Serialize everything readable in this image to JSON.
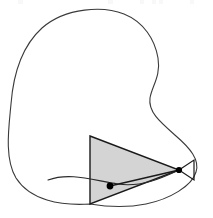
{
  "figure": {
    "canvas": {
      "width": 213,
      "height": 218,
      "background": "#ffffff"
    },
    "colors": {
      "stroke": "#3a3a3a",
      "triangle_fill": "#d4d4d4",
      "triangle_stroke": "#1a1a1a",
      "dot_fill": "#000000",
      "chord_stroke": "#1a1a1a",
      "artifact": "#f3f3f4"
    },
    "strokes": {
      "blob_width": 1.1,
      "triangle_width": 1.4,
      "chord_width": 1.3,
      "inner_curve_width": 1.1
    },
    "blob": {
      "label": "outer region boundary",
      "path": "M 90 204 C 60 206 30 200 16 178 C 4 158 9 126 11 104 C 13 78 20 48 42 28 C 66 7 104 6 124 14 C 144 22 155 40 158 58 C 161 76 152 86 150 98 C 148 112 160 122 176 136 C 190 148 200 160 196 172 C 192 186 170 199 146 204 C 126 208 108 207 90 204 Z",
      "closed": true,
      "filled": false
    },
    "inner_curve": {
      "label": "secant curve through contact points",
      "path": "M 48 180 C 70 172 92 180 118 184 C 142 188 166 176 179 170"
    },
    "triangle": {
      "label": "inscribed shaded triangle",
      "vertices": [
        {
          "name": "top-left",
          "x": 90,
          "y": 136
        },
        {
          "name": "apex-right",
          "x": 179,
          "y": 170
        },
        {
          "name": "bottom-left",
          "x": 90,
          "y": 204
        }
      ],
      "fill": "#d4d4d4",
      "stroke": "#1a1a1a"
    },
    "small_triangle": {
      "label": "outer tangent wedge",
      "vertices": [
        {
          "name": "apex-left",
          "x": 179,
          "y": 170
        },
        {
          "name": "top-right",
          "x": 194,
          "y": 160
        },
        {
          "name": "bottom-right",
          "x": 194,
          "y": 180
        }
      ],
      "fill": "none",
      "stroke": "#1a1a1a"
    },
    "chord": {
      "label": "chord joining the two marked points",
      "from": {
        "x": 110,
        "y": 186
      },
      "to": {
        "x": 179,
        "y": 170
      }
    },
    "points": [
      {
        "name": "interior-contact-point",
        "x": 110,
        "y": 186,
        "radius": 3.4
      },
      {
        "name": "boundary-contact-point",
        "x": 179,
        "y": 170,
        "radius": 3.1
      }
    ],
    "top_artifacts": [
      {
        "x": 18,
        "width": 5
      },
      {
        "x": 19,
        "width": 4
      },
      {
        "x": 108,
        "width": 5
      },
      {
        "x": 140,
        "width": 4
      },
      {
        "x": 152,
        "width": 4
      },
      {
        "x": 158,
        "width": 4
      },
      {
        "x": 190,
        "width": 4
      }
    ]
  }
}
